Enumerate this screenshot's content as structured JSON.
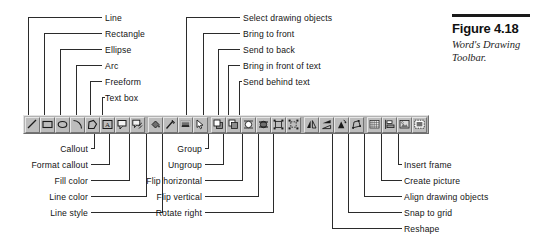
{
  "figure": {
    "title": "Figure 4.18",
    "subtitle": "Word's Drawing Toolbar."
  },
  "callouts_top_left": [
    {
      "label": "Line",
      "icon": "line-icon"
    },
    {
      "label": "Rectangle",
      "icon": "rectangle-icon"
    },
    {
      "label": "Ellipse",
      "icon": "ellipse-icon"
    },
    {
      "label": "Arc",
      "icon": "arc-icon"
    },
    {
      "label": "Freeform",
      "icon": "freeform-icon"
    },
    {
      "label": "Text box",
      "icon": "text-box-icon"
    }
  ],
  "callouts_top_right": [
    {
      "label": "Select drawing objects",
      "icon": "select-objects-icon"
    },
    {
      "label": "Bring to front",
      "icon": "bring-to-front-icon"
    },
    {
      "label": "Send to back",
      "icon": "send-to-back-icon"
    },
    {
      "label": "Bring in front of text",
      "icon": "bring-in-front-of-text-icon"
    },
    {
      "label": "Send behind text",
      "icon": "send-behind-text-icon"
    }
  ],
  "callouts_bottom_left": [
    {
      "label": "Callout",
      "icon": "callout-icon"
    },
    {
      "label": "Format callout",
      "icon": "format-callout-icon"
    },
    {
      "label": "Fill color",
      "icon": "fill-color-icon"
    },
    {
      "label": "Line color",
      "icon": "line-color-icon"
    },
    {
      "label": "Line style",
      "icon": "line-style-icon"
    }
  ],
  "callouts_bottom_mid": [
    {
      "label": "Group",
      "icon": "group-icon"
    },
    {
      "label": "Ungroup",
      "icon": "ungroup-icon"
    },
    {
      "label": "Flip horizontal",
      "icon": "flip-horizontal-icon"
    },
    {
      "label": "Flip vertical",
      "icon": "flip-vertical-icon"
    },
    {
      "label": "Rotate right",
      "icon": "rotate-right-icon"
    }
  ],
  "callouts_bottom_right": [
    {
      "label": "Insert frame",
      "icon": "insert-frame-icon"
    },
    {
      "label": "Create picture",
      "icon": "create-picture-icon"
    },
    {
      "label": "Align drawing objects",
      "icon": "align-drawing-objects-icon"
    },
    {
      "label": "Snap to grid",
      "icon": "snap-to-grid-icon"
    },
    {
      "label": "Reshape",
      "icon": "reshape-icon"
    }
  ],
  "toolbar": {
    "name": "Drawing",
    "buttons": [
      "line-icon",
      "rectangle-icon",
      "ellipse-icon",
      "arc-icon",
      "freeform-icon",
      "text-box-icon",
      "callout-icon",
      "format-callout-icon",
      "fill-color-icon",
      "line-color-icon",
      "line-style-icon",
      "select-objects-icon",
      "bring-to-front-icon",
      "send-to-back-icon",
      "bring-in-front-of-text-icon",
      "send-behind-text-icon",
      "group-icon",
      "ungroup-icon",
      "flip-horizontal-icon",
      "flip-vertical-icon",
      "rotate-right-icon",
      "reshape-icon",
      "snap-to-grid-icon",
      "align-drawing-objects-icon",
      "create-picture-icon",
      "insert-frame-icon"
    ]
  },
  "colors": {
    "ink": "#1a1a1a",
    "toolbar_face": "#b2b2b2",
    "button_face": "#bdbdbd",
    "highlight": "#e6e6e6",
    "shadow": "#737373"
  }
}
